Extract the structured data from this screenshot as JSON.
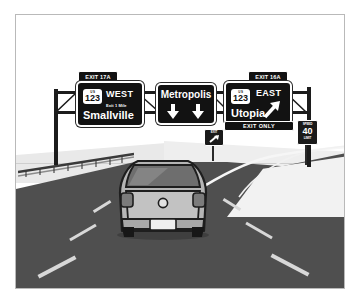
{
  "illustration": {
    "title": "Highway exit sign guidance diagram",
    "callouts": [
      {
        "id": "left-callout",
        "line1": "This exit will be",
        "line2": "on the left",
        "arrow": "down-arrow-icon"
      },
      {
        "id": "right-callout",
        "line1": "This exit will be",
        "line2": "on the right",
        "arrow": "down-arrow-icon"
      }
    ],
    "overhead_signs": [
      {
        "id": "left-guide-sign",
        "exit_tab": "EXIT 17A",
        "shield_label": "U S",
        "shield_number": "123",
        "direction": "West",
        "sub_line": "Exit 1 Mile",
        "destination": "Smallville",
        "exit_only": "",
        "arrow": "none"
      },
      {
        "id": "center-guide-sign",
        "exit_tab": "",
        "shield_label": "",
        "shield_number": "",
        "direction": "",
        "sub_line": "",
        "destination": "Metropolis",
        "exit_only": "",
        "arrow": "two-down-arrows-icon"
      },
      {
        "id": "right-guide-sign",
        "exit_tab": "EXIT 16A",
        "shield_label": "U S",
        "shield_number": "123",
        "direction": "East",
        "sub_line": "",
        "destination": "Utopia",
        "exit_only": "EXIT ONLY",
        "arrow": "up-right-arrow-icon"
      }
    ],
    "roadside_signs": [
      {
        "id": "gore-exit-sign",
        "top_text": "EXIT",
        "main_text": "",
        "bottom_text": ""
      },
      {
        "id": "speed-limit-sign",
        "top_text": "SPEED",
        "main_text": "40",
        "bottom_text": "LIMIT"
      }
    ],
    "scene_elements": {
      "vehicle": "grey-hatchback-car",
      "guardrail": "left-guardrail",
      "lane_markings": "dashed-white-lane-lines",
      "gantry": "overhead-sign-gantry"
    },
    "colors": {
      "sign_background": "#121212",
      "sign_text": "#ffffff",
      "road": "#4f4f4f",
      "lane_dash": "#d8d8d8",
      "ground": "#ececec",
      "frame_border": "#b9b9b9",
      "callout_text": "#1a1a1a",
      "car_body": "#b5b5b5"
    }
  }
}
